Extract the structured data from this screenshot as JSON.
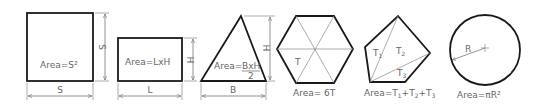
{
  "figures": [
    {
      "name": "square",
      "area_label": "Area=S²",
      "dimensions": {
        "width": "S",
        "height": "S"
      }
    },
    {
      "name": "rectangle",
      "area_label": "Area=LxH",
      "dimensions": {
        "width": "L",
        "height": "H"
      }
    },
    {
      "name": "triangle",
      "area_label_prefix": "Area=",
      "area_numerator": "BxH",
      "area_denominator": "2",
      "dimensions": {
        "width": "B",
        "height": "H"
      }
    },
    {
      "name": "hexagon",
      "area_label": "Area= 6T",
      "sub_triangle_label": "T"
    },
    {
      "name": "pentagon",
      "area_label_prefix": "Area=",
      "area_terms": [
        "T",
        "1",
        "+",
        "T",
        "2",
        "+",
        "T",
        "3"
      ],
      "triangle_labels": [
        "T1",
        "T2",
        "T3"
      ]
    },
    {
      "name": "circle",
      "area_label": "Area=πR²",
      "radius_label": "R"
    }
  ]
}
